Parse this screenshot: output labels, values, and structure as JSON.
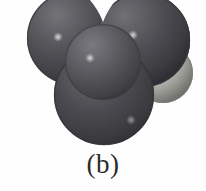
{
  "figure": {
    "caption": "(b)",
    "kind": "space-filling-molecular-model",
    "rendering": "grayscale halftone photograph",
    "background_color": "#fefefe"
  },
  "model": {
    "title": "space-filling molecular model",
    "atoms": [
      {
        "id": "sphere-upper-left",
        "label": "upper left sphere",
        "shade": "dark gray",
        "color": "#55555a",
        "edge_color": "#3a3a3f",
        "highlight_color": "#c9c9cb",
        "cx": 74,
        "cy": 38,
        "r": 47,
        "highlight_x": 58,
        "highlight_y": 37,
        "highlight_r": 4,
        "depth": 1
      },
      {
        "id": "sphere-upper-right",
        "label": "upper right sphere",
        "shade": "dark gray",
        "color": "#55555a",
        "edge_color": "#3a3a3f",
        "highlight_color": "#c9c9cb",
        "cx": 143,
        "cy": 40,
        "r": 47,
        "highlight_x": 133,
        "highlight_y": 35,
        "highlight_r": 4,
        "depth": 1
      },
      {
        "id": "sphere-hydrogen-right",
        "label": "small light sphere at right",
        "shade": "light gray",
        "color": "#b8b8b4",
        "edge_color": "#7d7d79",
        "highlight_color": "#ededea",
        "cx": 163,
        "cy": 73,
        "r": 30,
        "highlight_x": 152,
        "highlight_y": 61,
        "highlight_r": 4,
        "depth": 2
      },
      {
        "id": "sphere-bottom",
        "label": "bottom sphere",
        "shade": "dark gray",
        "color": "#4e4e53",
        "edge_color": "#343439",
        "highlight_color": "#b0b0b2",
        "cx": 104,
        "cy": 95,
        "r": 50,
        "highlight_x": 131,
        "highlight_y": 120,
        "highlight_r": 4,
        "depth": 3
      },
      {
        "id": "sphere-center-front",
        "label": "center front sphere",
        "shade": "medium dark gray",
        "color": "#5b5b60",
        "edge_color": "#3c3c41",
        "highlight_color": "#cfcfd1",
        "cx": 103,
        "cy": 62,
        "r": 38,
        "highlight_x": 90,
        "highlight_y": 58,
        "highlight_r": 4,
        "depth": 4
      }
    ],
    "notch": {
      "id": "top-notch",
      "label": "white v-notch between upper spheres",
      "color": "#fefefe"
    }
  }
}
